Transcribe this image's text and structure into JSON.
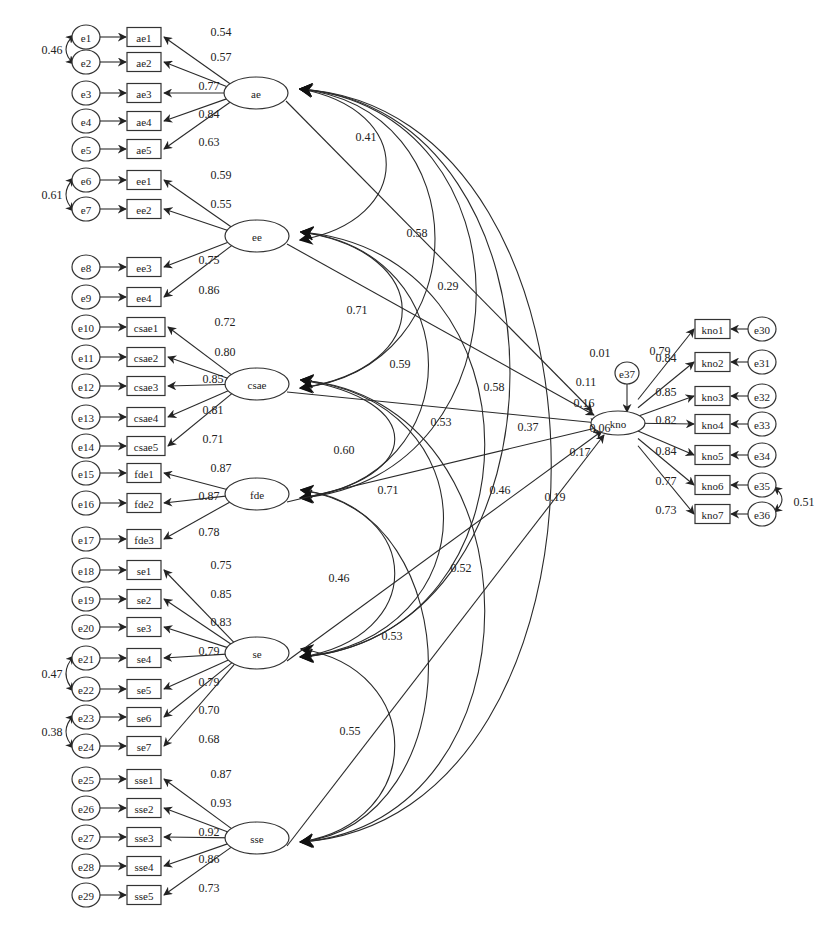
{
  "diagram": {
    "title": "",
    "latent_factors": [
      {
        "id": "ae",
        "label": "ae",
        "cx": 256,
        "cy": 93
      },
      {
        "id": "ee",
        "label": "ee",
        "cx": 257,
        "cy": 236
      },
      {
        "id": "csae",
        "label": "csae",
        "cx": 257,
        "cy": 384
      },
      {
        "id": "fde",
        "label": "fde",
        "cx": 257,
        "cy": 494
      },
      {
        "id": "se",
        "label": "se",
        "cx": 257,
        "cy": 653
      },
      {
        "id": "sse",
        "label": "sse",
        "cx": 257,
        "cy": 838
      }
    ],
    "outcome": {
      "id": "kno",
      "label": "kno",
      "cx": 618,
      "cy": 423,
      "disturbance": {
        "label": "e37",
        "cx": 627,
        "cy": 373
      }
    },
    "indicator_groups": [
      {
        "factor": "ae",
        "items": [
          {
            "label": "ae1",
            "error": "e1",
            "y": 37,
            "loading": "0.54"
          },
          {
            "label": "ae2",
            "error": "e2",
            "y": 62,
            "loading": "0.57"
          },
          {
            "label": "ae3",
            "error": "e3",
            "y": 93,
            "loading": "0.77"
          },
          {
            "label": "ae4",
            "error": "e4",
            "y": 121,
            "loading": "0.84"
          },
          {
            "label": "ae5",
            "error": "e5",
            "y": 149,
            "loading": "0.63"
          }
        ]
      },
      {
        "factor": "ee",
        "items": [
          {
            "label": "ee1",
            "error": "e6",
            "y": 180,
            "loading": "0.59"
          },
          {
            "label": "ee2",
            "error": "e7",
            "y": 209,
            "loading": "0.55"
          },
          {
            "label": "ee3",
            "error": "e8",
            "y": 267,
            "loading": "0.75"
          },
          {
            "label": "ee4",
            "error": "e9",
            "y": 297,
            "loading": "0.86"
          }
        ]
      },
      {
        "factor": "csae",
        "items": [
          {
            "label": "csae1",
            "error": "e10",
            "y": 327,
            "loading": "0.72"
          },
          {
            "label": "csae2",
            "error": "e11",
            "y": 357,
            "loading": "0.80"
          },
          {
            "label": "csae3",
            "error": "e12",
            "y": 386,
            "loading": "0.85"
          },
          {
            "label": "csae4",
            "error": "e13",
            "y": 417,
            "loading": "0.81"
          },
          {
            "label": "csae5",
            "error": "e14",
            "y": 446,
            "loading": "0.71"
          }
        ]
      },
      {
        "factor": "fde",
        "items": [
          {
            "label": "fde1",
            "error": "e15",
            "y": 473,
            "loading": "0.87"
          },
          {
            "label": "fde2",
            "error": "e16",
            "y": 503,
            "loading": "0.87"
          },
          {
            "label": "fde3",
            "error": "e17",
            "y": 539,
            "loading": "0.78"
          }
        ]
      },
      {
        "factor": "se",
        "items": [
          {
            "label": "se1",
            "error": "e18",
            "y": 570,
            "loading": "0.75"
          },
          {
            "label": "se2",
            "error": "e19",
            "y": 599,
            "loading": "0.85"
          },
          {
            "label": "se3",
            "error": "e20",
            "y": 627,
            "loading": "0.83"
          },
          {
            "label": "se4",
            "error": "e21",
            "y": 658,
            "loading": "0.79"
          },
          {
            "label": "se5",
            "error": "e22",
            "y": 689,
            "loading": "0.79"
          },
          {
            "label": "se6",
            "error": "e23",
            "y": 717,
            "loading": "0.70"
          },
          {
            "label": "se7",
            "error": "e24",
            "y": 746,
            "loading": "0.68"
          }
        ]
      },
      {
        "factor": "sse",
        "items": [
          {
            "label": "sse1",
            "error": "e25",
            "y": 779,
            "loading": "0.87"
          },
          {
            "label": "sse2",
            "error": "e26",
            "y": 808,
            "loading": "0.93"
          },
          {
            "label": "sse3",
            "error": "e27",
            "y": 837,
            "loading": "0.92"
          },
          {
            "label": "sse4",
            "error": "e28",
            "y": 866,
            "loading": "0.86"
          },
          {
            "label": "sse5",
            "error": "e29",
            "y": 895,
            "loading": "0.73"
          }
        ]
      }
    ],
    "outcome_indicators": [
      {
        "label": "kno1",
        "error": "e30",
        "y": 329,
        "loading": "0.79"
      },
      {
        "label": "kno2",
        "error": "e31",
        "y": 362,
        "loading": "0.84"
      },
      {
        "label": "kno3",
        "error": "e32",
        "y": 396,
        "loading": "0.85"
      },
      {
        "label": "kno4",
        "error": "e33",
        "y": 424,
        "loading": "0.82"
      },
      {
        "label": "kno5",
        "error": "e34",
        "y": 455,
        "loading": "0.84"
      },
      {
        "label": "kno6",
        "error": "e35",
        "y": 485,
        "loading": "0.77"
      },
      {
        "label": "kno7",
        "error": "e36",
        "y": 514,
        "loading": "0.73"
      }
    ],
    "error_covariances": [
      {
        "from": "e1",
        "to": "e2",
        "value": "0.46"
      },
      {
        "from": "e6",
        "to": "e7",
        "value": "0.61"
      },
      {
        "from": "e21",
        "to": "e22",
        "value": "0.47"
      },
      {
        "from": "e23",
        "to": "e24",
        "value": "0.38"
      },
      {
        "from": "e35",
        "to": "e36",
        "value": "0.51"
      }
    ],
    "factor_correlations": [
      {
        "from": "ae",
        "to": "ee",
        "value": "0.41"
      },
      {
        "from": "ae",
        "to": "csae",
        "value": "0.58"
      },
      {
        "from": "ee",
        "to": "csae",
        "value": "0.71"
      },
      {
        "from": "ee",
        "to": "fde",
        "value": "0.59"
      },
      {
        "from": "ae",
        "to": "fde",
        "value": "0.58"
      },
      {
        "from": "ee",
        "to": "se",
        "value": "0.53"
      },
      {
        "from": "ae",
        "to": "se",
        "value": "0.37"
      },
      {
        "from": "csae",
        "to": "fde",
        "value": "0.60"
      },
      {
        "from": "csae",
        "to": "se",
        "value": "0.71"
      },
      {
        "from": "ae",
        "to": "sse",
        "value": "0.46"
      },
      {
        "from": "fde",
        "to": "se",
        "value": "0.46"
      },
      {
        "from": "csae",
        "to": "sse",
        "value": "0.52"
      },
      {
        "from": "fde",
        "to": "sse",
        "value": "0.53"
      },
      {
        "from": "se",
        "to": "sse",
        "value": "0.55"
      }
    ],
    "structural_paths": [
      {
        "from": "ae",
        "to": "kno",
        "value": "0.01"
      },
      {
        "from": "ee",
        "to": "kno",
        "value": "0.29"
      },
      {
        "from": "ee",
        "to": "kno",
        "value": "0.11",
        "note": "second label near kno"
      },
      {
        "from": "csae",
        "to": "kno",
        "value": "0.16"
      },
      {
        "from": "fde",
        "to": "kno",
        "value": "0.06"
      },
      {
        "from": "se",
        "to": "kno",
        "value": "0.17"
      },
      {
        "from": "sse",
        "to": "kno",
        "value": "0.19"
      }
    ]
  }
}
